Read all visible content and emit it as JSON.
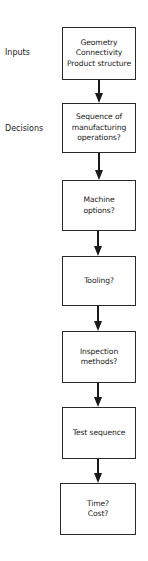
{
  "diagram": {
    "type": "flowchart",
    "direction": "top-to-bottom",
    "side_labels": [
      {
        "id": "inputs",
        "text": "Inputs"
      },
      {
        "id": "decisions",
        "text": "Decisions"
      }
    ],
    "steps": [
      {
        "id": "step-1",
        "text": "Geometry\nConnectivity\nProduct structure"
      },
      {
        "id": "step-2",
        "text": "Sequence of\nmanufacturing\noperations?"
      },
      {
        "id": "step-3",
        "text": "Machine\noptions?"
      },
      {
        "id": "step-4",
        "text": "Tooling?"
      },
      {
        "id": "step-5",
        "text": "Inspection\nmethods?"
      },
      {
        "id": "step-6",
        "text": "Test sequence"
      },
      {
        "id": "step-7",
        "text": "Time?\nCost?"
      }
    ],
    "edges": [
      {
        "from": "step-1",
        "to": "step-2"
      },
      {
        "from": "step-2",
        "to": "step-3"
      },
      {
        "from": "step-3",
        "to": "step-4"
      },
      {
        "from": "step-4",
        "to": "step-5"
      },
      {
        "from": "step-5",
        "to": "step-6"
      },
      {
        "from": "step-6",
        "to": "step-7"
      }
    ],
    "colors": {
      "line": "#1a1a1a",
      "background": "#ffffff"
    }
  }
}
